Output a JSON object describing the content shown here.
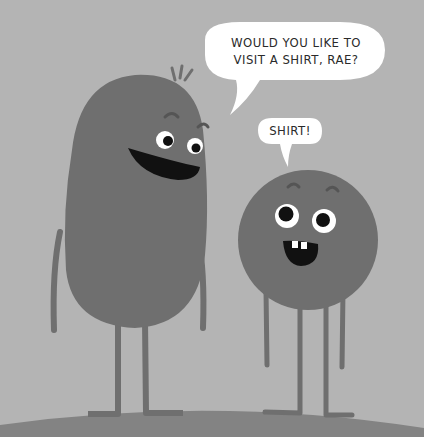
{
  "scene": {
    "description": "Illustration of two cartoon characters: a tall bean-shaped character and a small round character on a hill, with speech bubbles",
    "colors": {
      "background": "#b4b4b4",
      "character_body": "#6f6f6f",
      "ground": "#838383",
      "bubble": "#ffffff",
      "mouth": "#111111"
    }
  },
  "speech": {
    "tall_character": {
      "line1": "WOULD YOU LIKE TO",
      "line2": "VISIT A SHIRT, RAE?"
    },
    "round_character": {
      "line1": "SHIRT!"
    }
  }
}
